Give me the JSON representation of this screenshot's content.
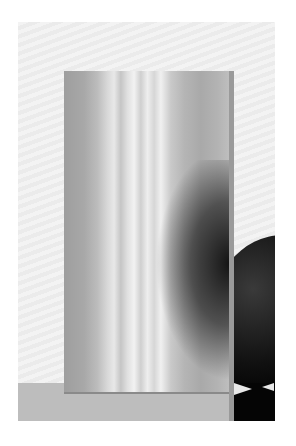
{
  "image": {
    "description": "Black-and-white photograph of a striated glass block standing in front of a dark sphere on a light surface",
    "subjects": [
      "glass-block",
      "dark-sphere",
      "floor-surface"
    ],
    "colors": {
      "background": "#f0f0f0",
      "block": "#c0c0c0",
      "sphere": "#000000",
      "floor": "#bdbdbd"
    }
  }
}
